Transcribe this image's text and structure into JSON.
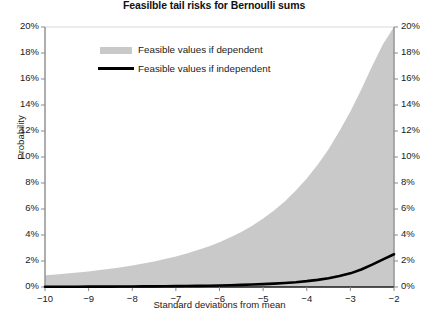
{
  "chart_data": {
    "type": "area",
    "title": "Feasilble tail risks for Bernoulli sums",
    "xlabel": "Standard deviations from mean",
    "ylabel": "Probability",
    "xlim": [
      -10,
      -2
    ],
    "ylim": [
      0,
      20
    ],
    "grid": false,
    "legend_position": "upper-left-inside",
    "x_ticks": [
      "−10",
      "−9",
      "−8",
      "−7",
      "−6",
      "−5",
      "−4",
      "−3",
      "−2"
    ],
    "x_tick_values": [
      -10,
      -9,
      -8,
      -7,
      -6,
      -5,
      -4,
      -3,
      -2
    ],
    "y_ticks_left": [
      "0%",
      "2%",
      "4%",
      "6%",
      "8%",
      "10%",
      "12%",
      "14%",
      "16%",
      "18%",
      "20%"
    ],
    "y_ticks_right": [
      "0%",
      "2%",
      "4%",
      "6%",
      "8%",
      "10%",
      "12%",
      "14%",
      "16%",
      "18%",
      "20%"
    ],
    "y_tick_values": [
      0,
      2,
      4,
      6,
      8,
      10,
      12,
      14,
      16,
      18,
      20
    ],
    "x": [
      -10,
      -9.75,
      -9.5,
      -9.25,
      -9,
      -8.75,
      -8.5,
      -8.25,
      -8,
      -7.75,
      -7.5,
      -7.25,
      -7,
      -6.75,
      -6.5,
      -6.25,
      -6,
      -5.75,
      -5.5,
      -5.25,
      -5,
      -4.75,
      -4.5,
      -4.25,
      -4,
      -3.75,
      -3.5,
      -3.25,
      -3,
      -2.75,
      -2.5,
      -2.25,
      -2
    ],
    "series": [
      {
        "name": "Feasible values if dependent",
        "kind": "area",
        "color": "#c9c9c9",
        "values": [
          0.9,
          0.97,
          1.04,
          1.12,
          1.2,
          1.3,
          1.4,
          1.52,
          1.65,
          1.8,
          1.97,
          2.15,
          2.35,
          2.58,
          2.84,
          3.12,
          3.45,
          3.82,
          4.24,
          4.72,
          5.26,
          5.88,
          6.6,
          7.42,
          8.35,
          9.4,
          10.6,
          12.0,
          13.5,
          15.2,
          17.0,
          18.7,
          20.0
        ]
      },
      {
        "name": "Feasible values if independent",
        "kind": "line",
        "color": "#000000",
        "values": [
          0.02,
          0.02,
          0.02,
          0.02,
          0.03,
          0.03,
          0.03,
          0.04,
          0.04,
          0.05,
          0.05,
          0.06,
          0.07,
          0.08,
          0.09,
          0.1,
          0.12,
          0.14,
          0.16,
          0.19,
          0.22,
          0.26,
          0.31,
          0.37,
          0.45,
          0.55,
          0.68,
          0.85,
          1.05,
          1.35,
          1.72,
          2.12,
          2.52
        ]
      }
    ],
    "legend": [
      {
        "label": "Feasible values if dependent",
        "marker": "fill-swatch",
        "color": "#c9c9c9"
      },
      {
        "label": "Feasible values if independent",
        "marker": "line-swatch",
        "color": "#000000"
      }
    ],
    "colors": {
      "area_fill": "#c9c9c9",
      "line": "#000000",
      "axis": "#999999",
      "text": "#1a1a1a",
      "background": "#ffffff"
    }
  }
}
